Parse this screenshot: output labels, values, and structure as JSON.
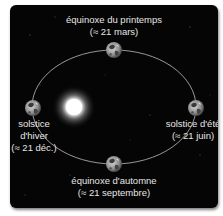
{
  "diagram": {
    "colors": {
      "background": "#050505",
      "text": "#e6e6e6",
      "orbit": "#bdbdbd",
      "sun": "#ffffff"
    },
    "positions": {
      "spring_equinox": {
        "line1": "équinoxe du printemps",
        "line2": "(≈ 21 mars)"
      },
      "winter_solstice": {
        "line1": "solstice",
        "line2": "d'hiver",
        "line3": "(≈ 21 déc.)"
      },
      "summer_solstice": {
        "line1": "solstice d'été",
        "line2": "(≈ 21 juin)"
      },
      "autumn_equinox": {
        "line1": "équinoxe d'automne",
        "line2": "(≈ 21 septembre)"
      }
    },
    "icons": {
      "sun": "sun-icon",
      "earth": "earth-icon"
    }
  }
}
